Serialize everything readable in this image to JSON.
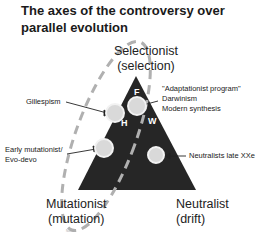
{
  "title": {
    "line1": "The axes of the controversy over",
    "line2": "parallel evolution"
  },
  "vertices": {
    "top": {
      "line1": "Selectionist",
      "line2": "(selection)"
    },
    "left": {
      "line1": "Mutationist",
      "line2": "(mutation)"
    },
    "right": {
      "line1": "Neutralist",
      "line2": "(drift)"
    }
  },
  "annotations": {
    "gillespism": "Gillespism",
    "adaptationist": "\"Adaptationist program\"",
    "darwinism": "Darwinism",
    "modern_synthesis": "Modern synthesis",
    "early_mutationist": "Early mutationist/",
    "evo_devo": "Evo-devo",
    "neutralists": "Neutralists late XXe"
  },
  "markers": {
    "F": "F",
    "H": "H",
    "W": "W"
  },
  "tiny_note": "Noval",
  "colors": {
    "triangle": "#262626",
    "dashed_loop": "#b0b0b0",
    "circle_fill": "#d9d9d9",
    "circle_stroke": "#f2f2f2"
  }
}
